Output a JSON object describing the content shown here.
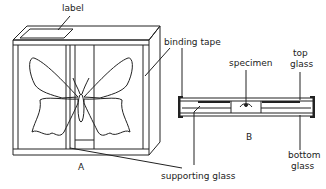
{
  "figure": {
    "panel_a": {
      "caption": "A",
      "labels": {
        "label": "label",
        "binding_tape": "binding tape",
        "supporting_glass": "supporting glass"
      }
    },
    "panel_b": {
      "caption": "B",
      "labels": {
        "specimen": "specimen",
        "top_glass_1": "top",
        "top_glass_2": "glass",
        "bottom_glass_1": "bottom",
        "bottom_glass_2": "glass"
      }
    },
    "colors": {
      "line": "#222222",
      "background": "#ffffff"
    }
  }
}
